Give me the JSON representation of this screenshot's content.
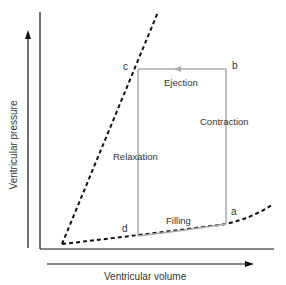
{
  "diagram": {
    "axes": {
      "x_label": "Ventricular volume",
      "y_label": "Ventricular pressure"
    },
    "points": {
      "a": "a",
      "b": "b",
      "c": "c",
      "d": "d"
    },
    "phases": {
      "ejection": "Ejection",
      "contraction": "Contraction",
      "relaxation": "Relaxation",
      "filling": "Filling"
    },
    "colors": {
      "loop": "#aaaaaa",
      "axes": "#111111",
      "dashed_curves": "#111111",
      "text": "#333333"
    }
  }
}
